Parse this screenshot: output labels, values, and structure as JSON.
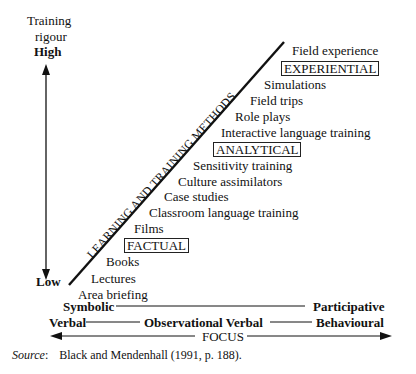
{
  "y_axis": {
    "title_line1": "Training",
    "title_line2": "rigour",
    "high_label": "High",
    "low_label": "Low"
  },
  "diagonal_label": "LEARNING AND TRAINING METHODS",
  "methods": [
    {
      "label": "Field experience"
    },
    {
      "label": "EXPERIENTIAL",
      "category": true
    },
    {
      "label": "Simulations"
    },
    {
      "label": "Field trips"
    },
    {
      "label": "Role plays"
    },
    {
      "label": "Interactive language training"
    },
    {
      "label": "ANALYTICAL",
      "category": true
    },
    {
      "label": "Sensitivity training"
    },
    {
      "label": "Culture assimilators"
    },
    {
      "label": "Case studies"
    },
    {
      "label": "Classroom language training"
    },
    {
      "label": "Films"
    },
    {
      "label": "FACTUAL",
      "category": true
    },
    {
      "label": "Books"
    },
    {
      "label": "Lectures"
    },
    {
      "label": "Area briefing"
    }
  ],
  "x_axis": {
    "row1_left": "Symbolic",
    "row1_right": "Participative",
    "row2_left": "Verbal",
    "row2_middle": "Observational Verbal",
    "row2_right": "Behavioural",
    "focus_label": "FOCUS"
  },
  "source": {
    "label": "Source",
    "text": "Black and Mendenhall (1991, p. 188)."
  }
}
